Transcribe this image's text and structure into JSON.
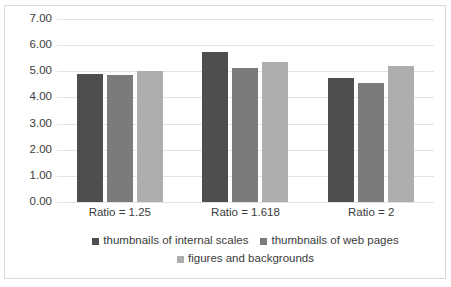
{
  "chart_data": {
    "type": "bar",
    "title": "",
    "subtitle": "",
    "xlabel": "",
    "ylabel": "",
    "categories": [
      "Ratio = 1.25",
      "Ratio = 1.618",
      "Ratio = 2"
    ],
    "series": [
      {
        "name": "thumbnails of internal scales",
        "color": "#4e4e4e",
        "values": [
          4.88,
          5.75,
          4.73
        ]
      },
      {
        "name": "thumbnails of web pages",
        "color": "#7b7b7b",
        "values": [
          4.84,
          5.13,
          4.57
        ]
      },
      {
        "name": "figures and backgrounds",
        "color": "#aeaeae",
        "values": [
          5.0,
          5.35,
          5.22
        ]
      }
    ],
    "ylim": [
      0,
      7
    ],
    "ytick_step": 1,
    "ytick_labels": [
      "0.00",
      "1.00",
      "2.00",
      "3.00",
      "4.00",
      "5.00",
      "6.00",
      "7.00"
    ],
    "grid": true,
    "grid_color": "#e3e3e3",
    "legend_position": "bottom",
    "plot_background": "#ffffff",
    "border_color": "#d9d9d9"
  }
}
